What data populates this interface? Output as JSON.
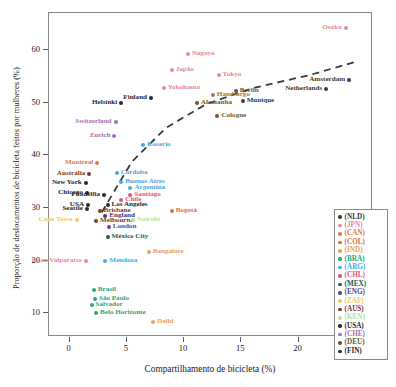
{
  "chart_data": {
    "type": "scatter",
    "title": "",
    "xlabel": "Compartilhamento de bicicleta (%)",
    "ylabel": "Proporção de deslocamentos de bicicleta feitos por mulheres (%)",
    "xlim": [
      -1.8,
      26.5
    ],
    "ylim": [
      5.5,
      67.0
    ],
    "xticks": [
      0,
      5,
      10,
      15,
      20,
      25
    ],
    "xticklabels": [
      "0",
      "5",
      "10",
      "15",
      "20",
      "25"
    ],
    "yticks": [
      10,
      20,
      30,
      40,
      50,
      60
    ],
    "yticklabels": [
      "10",
      "20",
      "30",
      "40",
      "50",
      "60"
    ],
    "grid": false,
    "legend_position": "right-lower",
    "trendline": {
      "style": "dashed",
      "color": "#3b3b3b",
      "points": [
        [
          2.9,
          29.0
        ],
        [
          5.5,
          38.5
        ],
        [
          8.5,
          45.0
        ],
        [
          12.0,
          49.5
        ],
        [
          16.0,
          52.5
        ],
        [
          21.0,
          55.0
        ],
        [
          25.0,
          57.5
        ]
      ]
    },
    "points": [
      {
        "label": "Osaka",
        "x": 24.2,
        "y": 64.0,
        "color": "#e8879c",
        "anchor": "r",
        "country": "JPN"
      },
      {
        "label": "Nagoya",
        "x": 10.4,
        "y": 59.0,
        "color": "#e8879c",
        "anchor": "l",
        "country": "JPN"
      },
      {
        "label": "Tokyo",
        "x": 13.1,
        "y": 55.0,
        "color": "#e8879c",
        "anchor": "l",
        "country": "JPN"
      },
      {
        "label": "Japão",
        "x": 9.0,
        "y": 56.0,
        "color": "#e8879c",
        "anchor": "l",
        "country": "JPN"
      },
      {
        "label": "Amsterdam",
        "x": 24.5,
        "y": 54.0,
        "color": "#3b3b3b",
        "anchor": "r",
        "country": "NLD"
      },
      {
        "label": "Netherlands",
        "x": 22.5,
        "y": 52.3,
        "color": "#3b3b3b",
        "anchor": "r",
        "country": "NLD"
      },
      {
        "label": "Yokohama",
        "x": 8.3,
        "y": 52.5,
        "color": "#e8879c",
        "anchor": "l",
        "country": "JPN"
      },
      {
        "label": "Hamburgo",
        "x": 12.6,
        "y": 51.3,
        "color": "#9a7a4a",
        "anchor": "l",
        "country": "DEU"
      },
      {
        "label": "Berlin",
        "x": 14.6,
        "y": 52.0,
        "color": "#6b5a2a",
        "anchor": "l",
        "country": "DEU"
      },
      {
        "label": "Finland",
        "x": 7.2,
        "y": 50.6,
        "color": "#2a2a2a",
        "anchor": "r",
        "country": "FIN"
      },
      {
        "label": "Helsinki",
        "x": 4.6,
        "y": 49.7,
        "color": "#2a2a2a",
        "anchor": "r",
        "country": "FIN"
      },
      {
        "label": "Alemanha",
        "x": 11.2,
        "y": 49.7,
        "color": "#6b5a2a",
        "anchor": "l",
        "country": "DEU"
      },
      {
        "label": "Munique",
        "x": 15.2,
        "y": 50.2,
        "color": "#3b3b3b",
        "anchor": "l",
        "country": "DEU"
      },
      {
        "label": "Cologne",
        "x": 13.0,
        "y": 47.3,
        "color": "#6b5a2a",
        "anchor": "l",
        "country": "DEU"
      },
      {
        "label": "Switzerland",
        "x": 4.1,
        "y": 46.2,
        "color": "#a36fb8",
        "anchor": "r",
        "country": "CHE"
      },
      {
        "label": "Zurich",
        "x": 4.0,
        "y": 43.4,
        "color": "#a36fb8",
        "anchor": "r",
        "country": "CHE"
      },
      {
        "label": "Rosario",
        "x": 6.5,
        "y": 41.8,
        "color": "#4aa8e0",
        "anchor": "l",
        "country": "ARG"
      },
      {
        "label": "Montreal",
        "x": 2.5,
        "y": 38.3,
        "color": "#e07a4a",
        "anchor": "r",
        "country": "CAN"
      },
      {
        "label": "Austrália",
        "x": 1.8,
        "y": 36.3,
        "color": "#7a3a2a",
        "anchor": "r",
        "country": "AUS"
      },
      {
        "label": "Córdoba",
        "x": 4.2,
        "y": 36.5,
        "color": "#4aa8e0",
        "anchor": "l",
        "country": "ARG"
      },
      {
        "label": "Buenos Aires",
        "x": 4.6,
        "y": 34.8,
        "color": "#4aa8e0",
        "anchor": "l",
        "country": "ARG"
      },
      {
        "label": "New York",
        "x": 1.5,
        "y": 34.6,
        "color": "#2a2a2a",
        "anchor": "r",
        "country": "USA"
      },
      {
        "label": "Argentina",
        "x": 5.4,
        "y": 33.6,
        "color": "#4aa8e0",
        "anchor": "l",
        "country": "ARG"
      },
      {
        "label": "Chicago",
        "x": 1.6,
        "y": 32.6,
        "color": "#2a2a2a",
        "anchor": "r",
        "country": "USA"
      },
      {
        "label": "Filadélfia",
        "x": 3.1,
        "y": 32.2,
        "color": "#2a2a2a",
        "anchor": "r",
        "country": "USA"
      },
      {
        "label": "Santiago",
        "x": 5.4,
        "y": 32.3,
        "color": "#e8557a",
        "anchor": "l",
        "country": "CHL"
      },
      {
        "label": "Chile",
        "x": 4.6,
        "y": 31.3,
        "color": "#e8557a",
        "anchor": "l",
        "country": "CHL"
      },
      {
        "label": "USA",
        "x": 1.7,
        "y": 30.4,
        "color": "#2a2a2a",
        "anchor": "r",
        "country": "USA"
      },
      {
        "label": "Los Angeles",
        "x": 3.4,
        "y": 30.4,
        "color": "#2a2a2a",
        "anchor": "l",
        "country": "USA"
      },
      {
        "label": "Seattle",
        "x": 1.6,
        "y": 29.6,
        "color": "#2a2a2a",
        "anchor": "r",
        "country": "USA"
      },
      {
        "label": "Brisbane",
        "x": 2.7,
        "y": 29.2,
        "color": "#7a3a2a",
        "anchor": "l",
        "country": "AUS"
      },
      {
        "label": "Bogotá",
        "x": 9.0,
        "y": 29.2,
        "color": "#e06a4a",
        "anchor": "l",
        "country": "COL"
      },
      {
        "label": "England",
        "x": 3.2,
        "y": 28.2,
        "color": "#4a3a6a",
        "anchor": "l",
        "country": "ENG"
      },
      {
        "label": "Melbourne",
        "x": 2.4,
        "y": 27.4,
        "color": "#7a3a2a",
        "anchor": "l",
        "country": "AUS"
      },
      {
        "label": "Cape Town",
        "x": 0.7,
        "y": 27.5,
        "color": "#f0c868",
        "anchor": "r",
        "country": "ZAF"
      },
      {
        "label": "Nairobi",
        "x": 5.6,
        "y": 27.5,
        "color": "#b8e0a8",
        "anchor": "l",
        "country": "KEN"
      },
      {
        "label": "London",
        "x": 3.5,
        "y": 26.2,
        "color": "#5a4a8a",
        "anchor": "l",
        "country": "ENG"
      },
      {
        "label": "México City",
        "x": 3.4,
        "y": 24.2,
        "color": "#2a5a4a",
        "anchor": "l",
        "country": "MEX"
      },
      {
        "label": "Bangalore",
        "x": 7.0,
        "y": 21.4,
        "color": "#e8a05a",
        "anchor": "l",
        "country": "IND"
      },
      {
        "label": "Mendoza",
        "x": 3.2,
        "y": 19.7,
        "color": "#4aa8e0",
        "anchor": "l",
        "country": "ARG"
      },
      {
        "label": "Gran Valparaíso",
        "x": 1.5,
        "y": 19.7,
        "color": "#e8879c",
        "anchor": "r",
        "country": "CHL"
      },
      {
        "label": "Brasil",
        "x": 2.2,
        "y": 14.2,
        "color": "#2aa87a",
        "anchor": "l",
        "country": "BRA"
      },
      {
        "label": "São Paulo",
        "x": 2.3,
        "y": 12.6,
        "color": "#2aa87a",
        "anchor": "l",
        "country": "BRA"
      },
      {
        "label": "Salvador",
        "x": 2.0,
        "y": 11.3,
        "color": "#2aa87a",
        "anchor": "l",
        "country": "BRA"
      },
      {
        "label": "Belo Horizonte",
        "x": 2.4,
        "y": 9.9,
        "color": "#2aa87a",
        "anchor": "l",
        "country": "BRA"
      },
      {
        "label": "Delhi",
        "x": 7.4,
        "y": 8.2,
        "color": "#e8a05a",
        "anchor": "l",
        "country": "IND"
      }
    ],
    "legend": {
      "title": "",
      "entries": [
        {
          "code": "(NLD)",
          "color": "#3b3b3b"
        },
        {
          "code": "(JPN)",
          "color": "#e8879c"
        },
        {
          "code": "(CAN)",
          "color": "#e07a4a"
        },
        {
          "code": "(COL)",
          "color": "#e06a4a"
        },
        {
          "code": "(IND)",
          "color": "#e8a05a"
        },
        {
          "code": "(BRA)",
          "color": "#2aa87a"
        },
        {
          "code": "(ARG)",
          "color": "#4aa8e0"
        },
        {
          "code": "(CHL)",
          "color": "#e8557a"
        },
        {
          "code": "(MEX)",
          "color": "#2a5a4a"
        },
        {
          "code": "(ENG)",
          "color": "#5a4a8a"
        },
        {
          "code": "(ZAF)",
          "color": "#f0c868"
        },
        {
          "code": "(AUS)",
          "color": "#7a3a2a"
        },
        {
          "code": "(KEN)",
          "color": "#b8e0a8"
        },
        {
          "code": "(USA)",
          "color": "#2a2a2a"
        },
        {
          "code": "(CHE)",
          "color": "#a36fb8"
        },
        {
          "code": "(DEU)",
          "color": "#6b5a2a"
        },
        {
          "code": "(FIN)",
          "color": "#2a2a2a"
        }
      ]
    }
  }
}
